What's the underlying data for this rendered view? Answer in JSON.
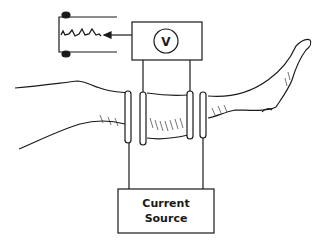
{
  "diagram": {
    "voltmeter": {
      "symbol": "V"
    },
    "current_source": {
      "label_line1": "Current",
      "label_line2": "Source"
    },
    "recorder": {
      "trace": "waveform"
    },
    "colors": {
      "ink": "#1a1a1a",
      "background": "#ffffff"
    }
  }
}
